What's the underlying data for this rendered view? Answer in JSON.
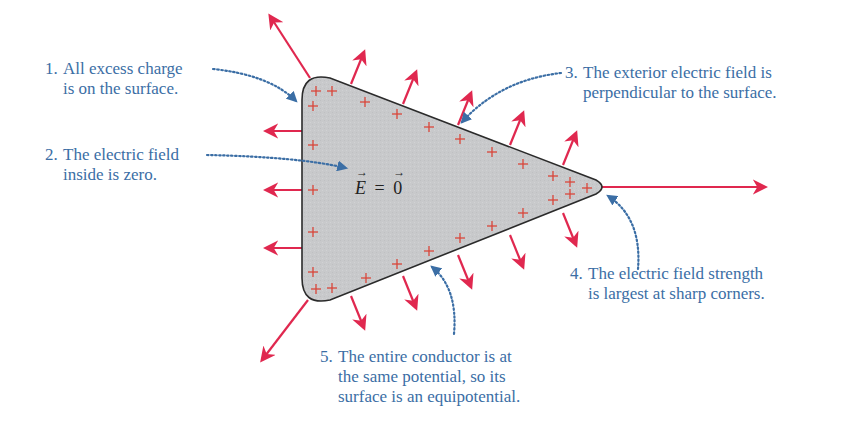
{
  "figure": {
    "type": "conductor-electrostatics-diagram",
    "colors": {
      "conductor_fill": "#c8c9cb",
      "conductor_outline": "#2b2b2b",
      "charge_plus": "#d9463a",
      "field_arrow": "#e0284f",
      "annotation_text": "#3b6ea5",
      "annotation_leader": "#3b6ea5"
    },
    "interior_equation": {
      "lhs": "E",
      "equals": "=",
      "rhs": "0"
    },
    "charge_symbol": "+",
    "annotations": [
      {
        "id": 1,
        "number": "1.",
        "lines": [
          "All excess charge",
          "is on the surface."
        ]
      },
      {
        "id": 2,
        "number": "2.",
        "lines": [
          "The electric field",
          "inside is zero."
        ]
      },
      {
        "id": 3,
        "number": "3.",
        "lines": [
          "The exterior electric field is",
          "perpendicular to the surface."
        ]
      },
      {
        "id": 4,
        "number": "4.",
        "lines": [
          "The electric field strength",
          "is largest at sharp corners."
        ]
      },
      {
        "id": 5,
        "number": "5.",
        "lines": [
          "The entire conductor is at",
          "the same potential, so its",
          "surface is an equipotential."
        ]
      }
    ]
  }
}
